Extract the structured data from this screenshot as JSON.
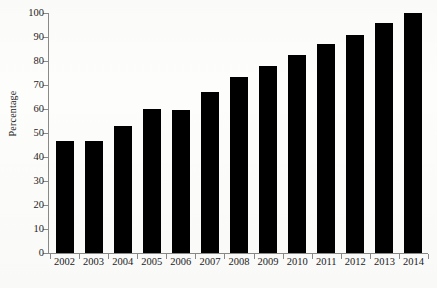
{
  "chart_data": {
    "type": "bar",
    "title": "",
    "xlabel": "",
    "ylabel": "Percentage",
    "categories": [
      "2002",
      "2003",
      "2004",
      "2005",
      "2006",
      "2007",
      "2008",
      "2009",
      "2010",
      "2011",
      "2012",
      "2013",
      "2014"
    ],
    "values": [
      46.5,
      46.5,
      53,
      60,
      59.5,
      67,
      73.5,
      78,
      82.5,
      87,
      91,
      96,
      100
    ],
    "ylim": [
      0,
      100
    ],
    "ytick_labels": [
      "0",
      "10",
      "20",
      "30",
      "40",
      "50",
      "60",
      "70",
      "80",
      "90",
      "100"
    ],
    "ytick_values": [
      0,
      10,
      20,
      30,
      40,
      50,
      60,
      70,
      80,
      90,
      100
    ],
    "grid": false,
    "legend": false,
    "bar_color": "#000000",
    "axis_color": "#8a8a8a",
    "background_color": "#fdfdfc"
  }
}
